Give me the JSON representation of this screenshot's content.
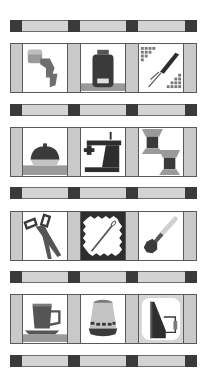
{
  "colors": {
    "background": "#ffffff",
    "sashing_light": "#d3d3d3",
    "cornerstone_dark": "#3a3a3a",
    "side_strip": "#c9c9c9",
    "outline": "#5a5a5a",
    "icon_dark": "#333333",
    "icon_mid": "#7a7a7a",
    "icon_light": "#b5b5b5"
  },
  "rows": [
    {
      "panels": [
        {
          "icon": "thread-spool-with-zigzag-icon"
        },
        {
          "icon": "jar-icon"
        },
        {
          "icon": "seam-ripper-icon"
        }
      ]
    },
    {
      "panels": [
        {
          "icon": "pincushion-icon"
        },
        {
          "icon": "sewing-machine-icon"
        },
        {
          "icon": "thread-spools-icon"
        }
      ]
    },
    {
      "panels": [
        {
          "icon": "scissors-icon"
        },
        {
          "icon": "needle-on-pinked-fabric-icon"
        },
        {
          "icon": "pin-icon"
        }
      ]
    },
    {
      "panels": [
        {
          "icon": "teacup-icon"
        },
        {
          "icon": "thimble-icon"
        },
        {
          "icon": "iron-icon"
        }
      ]
    }
  ]
}
